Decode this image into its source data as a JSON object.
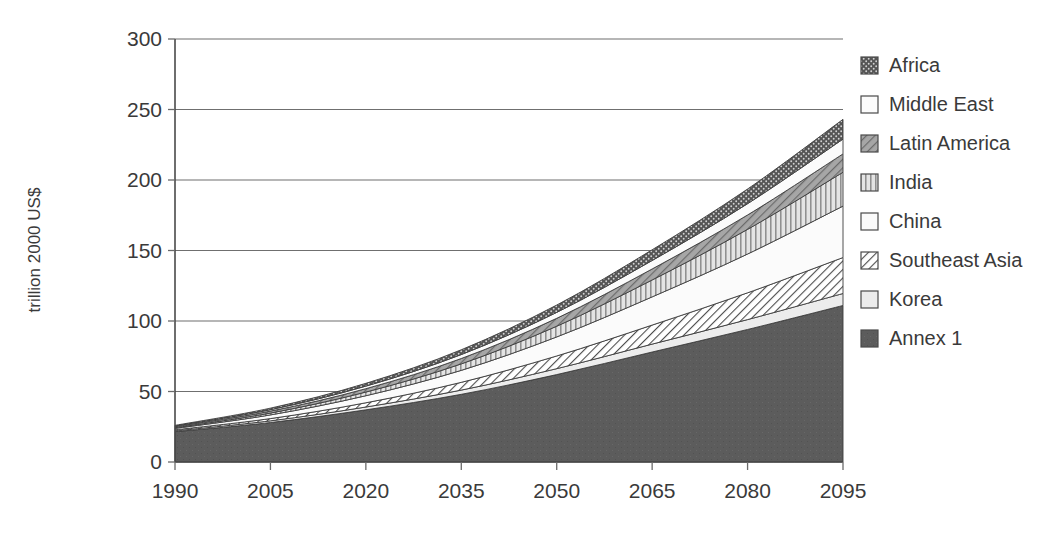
{
  "chart_data": {
    "type": "area",
    "stacked": true,
    "title": "",
    "subtitle": "",
    "xlabel": "",
    "ylabel": "trillion 2000 US$",
    "xlim": [
      1990,
      2095
    ],
    "ylim": [
      0,
      300
    ],
    "grid": true,
    "legend_position": "right",
    "x": [
      1990,
      2005,
      2020,
      2035,
      2050,
      2065,
      2080,
      2095
    ],
    "xtick_labels": [
      "1990",
      "2005",
      "2020",
      "2035",
      "2050",
      "2065",
      "2080",
      "2095"
    ],
    "ytick_values": [
      0,
      50,
      100,
      150,
      200,
      250,
      300
    ],
    "ytick_labels": [
      "0",
      "50",
      "100",
      "150",
      "200",
      "250",
      "300"
    ],
    "stack_order_bottom_to_top": [
      "Annex 1",
      "Korea",
      "Southeast Asia",
      "China",
      "India",
      "Latin America",
      "Middle East",
      "Africa"
    ],
    "series": [
      {
        "name": "Annex 1",
        "pattern": "solid-dark",
        "color": "#595959",
        "values": [
          21.5,
          28.0,
          37.0,
          48.0,
          62.0,
          78.0,
          94.0,
          111.0
        ]
      },
      {
        "name": "Korea",
        "pattern": "light-solid",
        "color": "#e8e8e8",
        "values": [
          0.6,
          1.2,
          2.0,
          3.0,
          4.2,
          5.6,
          7.0,
          8.5
        ]
      },
      {
        "name": "Southeast Asia",
        "pattern": "diagonal-hatch",
        "color": "#f2f2f2",
        "values": [
          0.7,
          1.6,
          3.0,
          5.5,
          9.0,
          13.5,
          19.0,
          25.5
        ]
      },
      {
        "name": "China",
        "pattern": "white-plain",
        "color": "#fbfbfb",
        "values": [
          1.0,
          2.6,
          5.0,
          8.5,
          13.5,
          20.0,
          27.5,
          36.5
        ]
      },
      {
        "name": "India",
        "pattern": "vertical-lines",
        "color": "#d9d9d9",
        "values": [
          0.5,
          1.3,
          2.6,
          4.6,
          7.6,
          12.0,
          17.5,
          24.0
        ]
      },
      {
        "name": "Latin America",
        "pattern": "gray-diagonal",
        "color": "#9e9e9e",
        "values": [
          0.7,
          1.4,
          2.4,
          3.8,
          5.6,
          7.8,
          10.2,
          13.0
        ]
      },
      {
        "name": "Middle East",
        "pattern": "white-plain",
        "color": "#fdfdfd",
        "values": [
          0.5,
          1.0,
          1.8,
          2.8,
          4.2,
          6.0,
          8.0,
          10.5
        ]
      },
      {
        "name": "Africa",
        "pattern": "dark-dotted",
        "color": "#5f5f5f",
        "values": [
          0.5,
          1.1,
          2.0,
          3.4,
          5.2,
          7.6,
          10.4,
          14.0
        ]
      }
    ],
    "totals": [
      26.0,
      38.2,
      55.8,
      79.6,
      111.3,
      150.5,
      193.6,
      243.0
    ],
    "annotations": []
  },
  "legend": {
    "items": [
      {
        "label": "Africa",
        "pattern": "dark-dotted"
      },
      {
        "label": "Middle East",
        "pattern": "white-plain"
      },
      {
        "label": "Latin America",
        "pattern": "gray-diagonal"
      },
      {
        "label": "India",
        "pattern": "vertical-lines"
      },
      {
        "label": "China",
        "pattern": "white-plain"
      },
      {
        "label": "Southeast Asia",
        "pattern": "diagonal-hatch"
      },
      {
        "label": "Korea",
        "pattern": "light-solid"
      },
      {
        "label": "Annex 1",
        "pattern": "solid-dark"
      }
    ]
  },
  "axes": {
    "y_title": "trillion 2000 US$"
  }
}
